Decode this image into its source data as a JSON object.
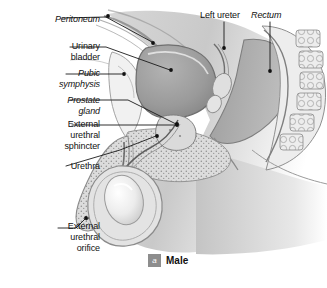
{
  "figure": {
    "domain": "anatomical-diagram",
    "title_caption": "Male",
    "caption_marker": "a",
    "orientation": "midsagittal section, male pelvis, facing left",
    "palette": {
      "background": "#ffffff",
      "ink": "#111111",
      "tissue_light": "#e9e9e9",
      "tissue_mid": "#bdbdbd",
      "tissue_dark": "#8f8f8f",
      "bladder_fill": "#9a9a9a",
      "rectum_fill": "#a8a8a8",
      "badge_gray": "#8d8d8d",
      "leader_line": "#1a1a1a"
    },
    "labels": [
      {
        "id": "peritoneum",
        "text": "Peritoneum",
        "style": "italic",
        "align": "right",
        "x": 8,
        "y": 14,
        "w": 92
      },
      {
        "id": "urinary-bladder",
        "text": "Urinary\nbladder",
        "style": "regular",
        "align": "right",
        "x": 8,
        "y": 41,
        "w": 92
      },
      {
        "id": "pubic-symphysis",
        "text": "Pubic\nsymphysis",
        "style": "italic",
        "align": "right",
        "x": 8,
        "y": 68,
        "w": 92
      },
      {
        "id": "prostate-gland",
        "text": "Prostate\ngland",
        "style": "italic",
        "align": "right",
        "x": 8,
        "y": 95,
        "w": 92
      },
      {
        "id": "external-urethral-sphincter",
        "text": "External\nurethral\nsphincter",
        "style": "regular",
        "align": "right",
        "x": 4,
        "y": 119,
        "w": 96
      },
      {
        "id": "urethra",
        "text": "Urethra",
        "style": "regular",
        "align": "right",
        "x": 8,
        "y": 161,
        "w": 92
      },
      {
        "id": "external-urethral-orifice",
        "text": "External\nurethral\norifice",
        "style": "regular",
        "align": "right",
        "x": 4,
        "y": 221,
        "w": 96
      },
      {
        "id": "left-ureter",
        "text": "Left ureter",
        "style": "regular",
        "align": "left",
        "x": 200,
        "y": 10,
        "w": 62
      },
      {
        "id": "rectum",
        "text": "Rectum",
        "style": "italic",
        "align": "left",
        "x": 251,
        "y": 10,
        "w": 50
      }
    ],
    "leaders": [
      {
        "id": "leader-peritoneum",
        "label": "Peritoneum",
        "path": "M62,18 L106,17",
        "dot": [
          108,
          16
        ]
      },
      {
        "id": "leader-peritoneum-branch",
        "label": "Peritoneum",
        "path": "M106,17 L152,42",
        "dot": [
          153,
          43
        ]
      },
      {
        "id": "leader-urinary-bladder",
        "label": "Urinary bladder",
        "path": "M70,47 L106,47 L170,70",
        "dot": [
          171,
          70
        ]
      },
      {
        "id": "leader-pubic-symphysis",
        "label": "Pubic symphysis",
        "path": "M66,74 L122,74",
        "dot": [
          124,
          74
        ]
      },
      {
        "id": "leader-prostate-gland",
        "label": "Prostate gland",
        "path": "M70,100 L128,100 L176,124",
        "dot": [
          177,
          124
        ]
      },
      {
        "id": "leader-external-urethral-sphincter",
        "label": "External urethral sphincter",
        "path": "M72,125 L176,125",
        "dot": [
          177,
          125
        ]
      },
      {
        "id": "leader-urethra",
        "label": "Urethra",
        "path": "M66,166 L120,150 L156,136",
        "dot": [
          157,
          136
        ]
      },
      {
        "id": "leader-external-urethral-orifice",
        "label": "External urethral orifice",
        "path": "M58,228 L76,228 L85,219",
        "dot": [
          86,
          218
        ]
      },
      {
        "id": "leader-left-ureter",
        "label": "Left ureter",
        "path": "M224,22 L224,47",
        "dot": [
          224,
          48
        ]
      },
      {
        "id": "leader-rectum",
        "label": "Rectum",
        "path": "M270,22 L270,70",
        "dot": [
          270,
          71
        ]
      }
    ],
    "structures": [
      {
        "id": "urinary-bladder",
        "kind": "organ",
        "note": "large dark-gray ovoid, upper centre-left"
      },
      {
        "id": "rectum",
        "kind": "organ",
        "note": "mid-gray column, centre-right"
      },
      {
        "id": "sacrum-vertebrae",
        "kind": "bone",
        "note": "stack of blocky vertebral bodies, far right"
      },
      {
        "id": "pubic-symphysis",
        "kind": "bone",
        "note": "pale wedge, left of bladder"
      },
      {
        "id": "prostate-gland",
        "kind": "gland",
        "note": "small stippled mass below bladder"
      },
      {
        "id": "penis-shaft",
        "kind": "organ",
        "note": "stippled downward-left column"
      },
      {
        "id": "urethra",
        "kind": "duct",
        "note": "thin channel through prostate and penis"
      },
      {
        "id": "scrotum-testis",
        "kind": "organ",
        "note": "light highlighted ovoid, lower centre"
      },
      {
        "id": "abdominal-wall",
        "kind": "soft-tissue",
        "note": "layered bands upper left"
      },
      {
        "id": "thigh-mass",
        "kind": "soft-tissue",
        "note": "gradient shading fading to white, lower right"
      }
    ]
  }
}
